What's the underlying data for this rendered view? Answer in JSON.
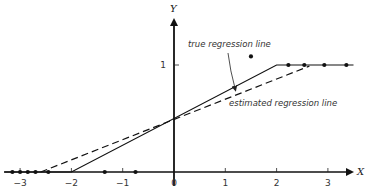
{
  "chart_data": {
    "type": "line",
    "title": "",
    "xlabel": "X",
    "ylabel": "Y",
    "xlim": [
      -3.3,
      3.6
    ],
    "ylim": [
      0,
      1.15
    ],
    "x_ticks": [
      -3,
      -2,
      -1,
      0,
      1,
      2,
      3
    ],
    "x_tick_labels": [
      "−3",
      "−2",
      "−1",
      "0",
      "1",
      "2",
      "3"
    ],
    "y_ticks": [
      1
    ],
    "y_tick_labels": [
      "1"
    ],
    "grid": false,
    "series": [
      {
        "name": "true regression line",
        "style": "solid",
        "points": [
          [
            -3.3,
            0
          ],
          [
            -2,
            0
          ],
          [
            2,
            1
          ],
          [
            3.5,
            1
          ]
        ]
      },
      {
        "name": "estimated regression line",
        "style": "dashed",
        "points": [
          [
            -2.6,
            0
          ],
          [
            2.64,
            0.99
          ]
        ]
      }
    ],
    "scatter": {
      "name": "observations",
      "points": [
        [
          -3.15,
          0
        ],
        [
          -3.0,
          0
        ],
        [
          -2.85,
          0
        ],
        [
          -2.7,
          0
        ],
        [
          -2.45,
          0
        ],
        [
          -1.35,
          0
        ],
        [
          -0.75,
          0
        ],
        [
          1.5,
          1.08
        ],
        [
          2.23,
          1
        ],
        [
          2.54,
          1
        ],
        [
          2.93,
          1
        ],
        [
          3.36,
          1
        ]
      ]
    },
    "annotations": [
      {
        "text": "true regression line",
        "points_to": [
          1.2,
          0.76
        ]
      },
      {
        "text": "estimated regression line"
      }
    ]
  }
}
